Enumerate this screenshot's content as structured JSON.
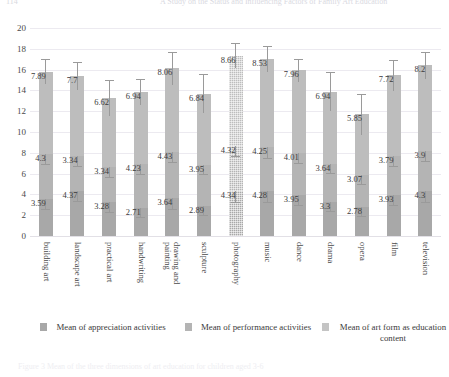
{
  "header": {
    "left_text": "114",
    "right_text": "A Study on the Status and Influencing Factors of Family Art Education"
  },
  "caption": {
    "text": "Figure 3  Mean of the three dimensions of art education for children aged 3-6"
  },
  "legend": {
    "position": "bottom",
    "items": [
      {
        "label_line1": "Mean of appreciation",
        "label_line2": "activities",
        "color": "#a8a8a8"
      },
      {
        "label_line1": "Mean of performance",
        "label_line2": "activities",
        "color": "#b4b4b4"
      },
      {
        "label_line1": "Mean of art form as",
        "label_line2": "education content",
        "color": "#c4c4c4"
      }
    ]
  },
  "axis": {
    "y_ticks": [
      "0",
      "2",
      "4",
      "6",
      "8",
      "10",
      "12",
      "14",
      "16",
      "18",
      "20"
    ]
  },
  "chart_data": {
    "type": "bar",
    "stacked": true,
    "title": "",
    "xlabel": "",
    "ylabel": "",
    "ylim": [
      0,
      20
    ],
    "grid": true,
    "legend_position": "bottom",
    "categories": [
      "building art",
      "landscape art",
      "practical art",
      "handwriting",
      "drawing and painting",
      "sculpture",
      "photography",
      "music",
      "dance",
      "drama",
      "opera",
      "film",
      "television"
    ],
    "series": [
      {
        "name": "Mean of appreciation activities",
        "color": "#a8a8a8",
        "values": [
          3.59,
          4.37,
          3.28,
          2.71,
          3.64,
          2.89,
          4.34,
          4.28,
          3.95,
          3.3,
          2.78,
          3.93,
          4.3
        ],
        "errors": [
          1.02,
          1.0,
          0.95,
          0.92,
          1.0,
          0.9,
          1.05,
          1.05,
          0.98,
          0.92,
          0.88,
          0.98,
          1.02
        ]
      },
      {
        "name": "Mean of performance activities",
        "color": "#b4b4b4",
        "values": [
          4.3,
          3.34,
          3.34,
          4.23,
          4.43,
          3.95,
          4.32,
          4.25,
          4.01,
          3.64,
          3.07,
          3.79,
          3.9
        ],
        "errors": [
          1.0,
          0.95,
          0.9,
          0.95,
          1.0,
          0.92,
          1.0,
          1.0,
          0.95,
          0.92,
          0.85,
          0.95,
          0.98
        ]
      },
      {
        "name": "Mean of art form as education content",
        "color": "#bdbdbd",
        "values": [
          7.89,
          7.7,
          6.62,
          6.94,
          8.06,
          6.84,
          8.66,
          8.53,
          7.96,
          6.94,
          5.85,
          7.72,
          8.2
        ],
        "errors": [
          1.2,
          1.35,
          1.75,
          1.25,
          1.6,
          1.85,
          1.2,
          1.25,
          1.1,
          1.85,
          1.95,
          1.45,
          1.3
        ]
      }
    ],
    "totals": [
      15.78,
      15.41,
      13.24,
      13.88,
      16.13,
      13.68,
      17.32,
      17.06,
      15.92,
      13.88,
      11.7,
      15.44,
      16.4
    ]
  }
}
